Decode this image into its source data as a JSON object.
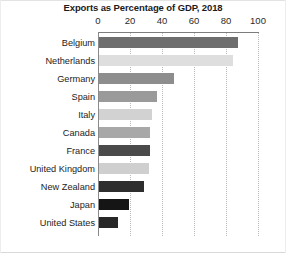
{
  "chart_data": {
    "type": "bar",
    "orientation": "horizontal",
    "title": "Exports as Percentage of GDP, 2018",
    "xlabel": "",
    "ylabel": "",
    "xlim": [
      0,
      100
    ],
    "xticks": [
      0,
      20,
      40,
      60,
      80,
      100
    ],
    "xtick_labels": [
      "0",
      "20",
      "40",
      "60",
      "80",
      "100"
    ],
    "grid": true,
    "grid_axis": "x",
    "grid_style": "dotted",
    "legend": false,
    "categories": [
      "Belgium",
      "Netherlands",
      "Germany",
      "Spain",
      "Italy",
      "Canada",
      "France",
      "United Kingdom",
      "New Zealand",
      "Japan",
      "United States"
    ],
    "values": [
      87,
      84,
      47,
      36,
      33,
      32,
      32,
      31,
      28,
      19,
      12
    ],
    "bar_colors": [
      "#6e6e6e",
      "#dedede",
      "#8d8d8d",
      "#9a9a9a",
      "#d2d2d2",
      "#a8a8a8",
      "#4a4a4a",
      "#cfcfcf",
      "#2e2e2e",
      "#151515",
      "#272727"
    ]
  },
  "axis": {
    "tick_0": "0",
    "tick_20": "20",
    "tick_40": "40",
    "tick_60": "60",
    "tick_80": "80",
    "tick_100": "100"
  }
}
